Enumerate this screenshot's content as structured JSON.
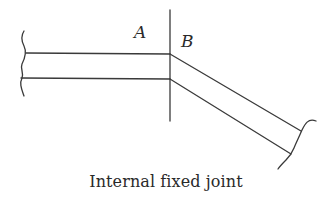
{
  "diagram": {
    "labels": {
      "a": "A",
      "b": "B"
    },
    "caption": "Internal fixed joint",
    "stroke_color": "#3a3a3a",
    "text_color": "#2a2a2a"
  }
}
